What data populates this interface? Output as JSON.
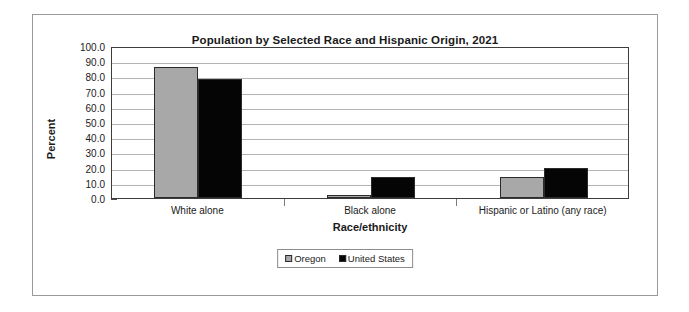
{
  "chart_data": {
    "type": "bar",
    "title": "Population by Selected Race and Hispanic Origin, 2021",
    "xlabel": "Race/ethnicity",
    "ylabel": "Percent",
    "categories": [
      "White alone",
      "Black alone",
      "Hispanic or Latino (any race)"
    ],
    "series": [
      {
        "name": "Oregon",
        "color": "#a8a8a8",
        "values": [
          86.0,
          2.0,
          14.0
        ]
      },
      {
        "name": "United States",
        "color": "#050505",
        "values": [
          78.5,
          14.0,
          19.5
        ]
      }
    ],
    "ylim": [
      0.0,
      100.0
    ],
    "ytick_labels": [
      "100.0",
      "90.0",
      "80.0",
      "70.0",
      "60.0",
      "50.0",
      "40.0",
      "30.0",
      "20.0",
      "10.0",
      "0.0"
    ],
    "ytick_values": [
      100.0,
      90.0,
      80.0,
      70.0,
      60.0,
      50.0,
      40.0,
      30.0,
      20.0,
      10.0,
      0.0
    ],
    "grid": true,
    "legend_position": "bottom-center"
  }
}
